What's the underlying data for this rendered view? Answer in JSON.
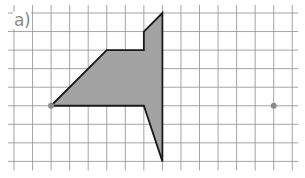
{
  "label": "a)",
  "grid": {
    "x_start": 14,
    "y_start": 13,
    "spacing": 18.55,
    "cols": 15,
    "rows": 8,
    "line_color": "#9a9a9a",
    "extend": 6
  },
  "shape": {
    "fill": "#a3a3a3",
    "stroke": "#1a1a1a",
    "vertices_grid": [
      [
        2,
        5
      ],
      [
        5,
        2
      ],
      [
        7,
        2
      ],
      [
        7,
        1
      ],
      [
        8,
        0
      ],
      [
        8,
        8
      ],
      [
        7,
        5
      ]
    ]
  },
  "points": [
    {
      "name": "left-point",
      "grid": [
        2,
        5
      ],
      "color": "#8a8a8a"
    },
    {
      "name": "right-point",
      "grid": [
        14,
        5
      ],
      "color": "#8a8a8a"
    }
  ]
}
